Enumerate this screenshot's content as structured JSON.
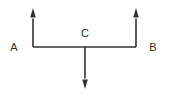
{
  "figure": {
    "canvas": {
      "width": 170,
      "height": 94,
      "background": "#ffffff"
    },
    "style": {
      "line_color": "#333333",
      "label_color": "#2b2b2b",
      "line_width": 1.6,
      "label_font_size": 11
    },
    "labels": {
      "left": "A",
      "center": "C",
      "right": "B"
    },
    "label_positions": {
      "left": {
        "x": 14,
        "y": 51
      },
      "center": {
        "x": 85,
        "y": 37
      },
      "right": {
        "x": 153,
        "y": 51
      }
    },
    "beam": {
      "name": "horizontal-beam",
      "x1": 33,
      "y1": 47,
      "x2": 136,
      "y2": 47
    },
    "arrows": [
      {
        "name": "left-up-arrow",
        "direction": "up",
        "tail": {
          "x": 33,
          "y": 47
        },
        "tip": {
          "x": 33,
          "y": 8
        },
        "head_width": 5.6,
        "head_length": 9.5
      },
      {
        "name": "right-up-arrow",
        "direction": "up",
        "tail": {
          "x": 136,
          "y": 47
        },
        "tip": {
          "x": 136,
          "y": 8
        },
        "head_width": 5.6,
        "head_length": 9.5
      },
      {
        "name": "center-down-arrow",
        "direction": "down",
        "tail": {
          "x": 85,
          "y": 47
        },
        "tip": {
          "x": 85,
          "y": 89
        },
        "head_width": 5.6,
        "head_length": 9.5
      }
    ]
  }
}
